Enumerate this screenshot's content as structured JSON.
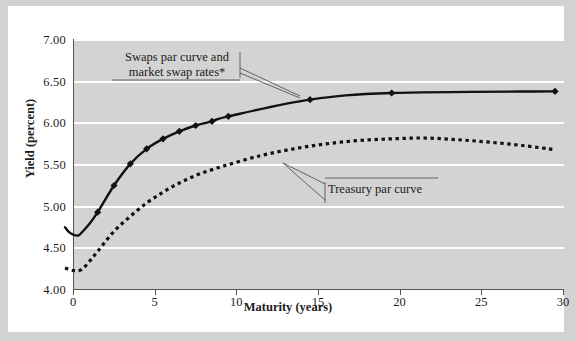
{
  "chart_data": {
    "type": "line",
    "title": "",
    "xlabel": "Maturity (years)",
    "ylabel": "Yield (percent)",
    "xlim": [
      0,
      30
    ],
    "ylim": [
      4.0,
      7.0
    ],
    "xticks": [
      0,
      5,
      10,
      15,
      20,
      25,
      30
    ],
    "xtick_labels": [
      "0",
      "5",
      "10",
      "15",
      "20",
      "25",
      "30"
    ],
    "yticks": [
      4.0,
      4.5,
      5.0,
      5.5,
      6.0,
      6.5,
      7.0
    ],
    "ytick_labels": [
      "4.00",
      "4.50",
      "5.00",
      "5.50",
      "6.00",
      "6.50",
      "7.00"
    ],
    "grid": "horizontal-white-gridlines",
    "plot_background": "#d3d3d3",
    "legend_position": "none-inline-annotations",
    "series": [
      {
        "name": "Swaps par curve and market swap rates*",
        "style": "solid-with-diamond-markers",
        "color": "#111111",
        "x": [
          0,
          0.25,
          0.5,
          0.8,
          1,
          1.5,
          2,
          3,
          4,
          5,
          6,
          7,
          8,
          9,
          10,
          15,
          20,
          30
        ],
        "y": [
          4.67,
          4.61,
          4.58,
          4.57,
          4.6,
          4.71,
          4.85,
          5.17,
          5.43,
          5.61,
          5.73,
          5.82,
          5.89,
          5.94,
          6.0,
          6.2,
          6.28,
          6.3
        ],
        "marker_x": [
          2,
          3,
          4,
          5,
          6,
          7,
          8,
          9,
          10,
          15,
          20,
          30
        ],
        "marker_y": [
          4.85,
          5.17,
          5.43,
          5.61,
          5.73,
          5.82,
          5.89,
          5.94,
          6.0,
          6.2,
          6.28,
          6.3
        ]
      },
      {
        "name": "Treasury par curve",
        "style": "dotted",
        "color": "#111111",
        "x": [
          0,
          0.5,
          1,
          1.5,
          2,
          3,
          4,
          5,
          6,
          7,
          8,
          9,
          10,
          12,
          14,
          16,
          18,
          20,
          22,
          24,
          26,
          28,
          30
        ],
        "y": [
          4.18,
          4.15,
          4.16,
          4.26,
          4.38,
          4.62,
          4.8,
          4.96,
          5.09,
          5.2,
          5.29,
          5.36,
          5.42,
          5.53,
          5.61,
          5.67,
          5.71,
          5.73,
          5.74,
          5.72,
          5.69,
          5.65,
          5.6
        ]
      }
    ],
    "annotations": [
      {
        "name": "swaps-annotation",
        "text": "Swaps par curve and\nmarket swap rates*",
        "points_to": [
          "swaps curve near maturity 13-15"
        ]
      },
      {
        "name": "treasury-annotation",
        "text": "Treasury par curve",
        "points_to": [
          "treasury dotted curve near maturity 13-15"
        ]
      }
    ]
  },
  "axes": {
    "x_title": "Maturity (years)",
    "y_title": "Yield (percent)"
  },
  "annotations": {
    "swaps_label": "Swaps par curve and\nmarket swap rates*",
    "treasury_label": "Treasury par curve"
  },
  "colors": {
    "plot_bg": "#d3d3d3",
    "gridline": "#ffffff",
    "curve": "#111111",
    "card_bg": "#ffffff",
    "mat_bg": "#d2d2d2",
    "axis": "#555555",
    "text": "#1c1c1c"
  }
}
